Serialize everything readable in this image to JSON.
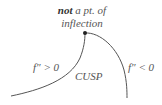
{
  "diagram": {
    "title_bold": "not",
    "title_rest": " a pt. of",
    "title_line2": "inflection",
    "left_label": "f″ > 0",
    "right_label": "f″ < 0",
    "center_label": "CUSP",
    "colors": {
      "curve": "#555555",
      "text": "#555555",
      "point": "#222222"
    }
  }
}
